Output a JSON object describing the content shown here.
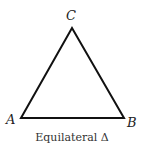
{
  "diagram": {
    "title": "Equilateral Δ",
    "vertices": [
      {
        "label": "A",
        "x": 21,
        "y": 118
      },
      {
        "label": "B",
        "x": 124,
        "y": 118
      },
      {
        "label": "C",
        "x": 72,
        "y": 28
      }
    ],
    "caption": "Equilateral Δ",
    "stroke_color": "#111111"
  }
}
